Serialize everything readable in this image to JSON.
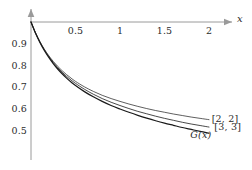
{
  "chart_data": {
    "type": "line",
    "title": "",
    "subtitle": "",
    "xlabel": "x",
    "ylabel": "",
    "xlim": [
      0,
      2.2
    ],
    "ylim": [
      0.45,
      1.0
    ],
    "grid": false,
    "legend_position": "inline-right-end",
    "x_ticks": [
      {
        "value": 0.5,
        "label": "0.5"
      },
      {
        "value": 1,
        "label": "1"
      },
      {
        "value": 1.5,
        "label": "1.5"
      },
      {
        "value": 2,
        "label": "2"
      }
    ],
    "y_ticks": [
      {
        "value": 0.9,
        "label": "0.9"
      },
      {
        "value": 0.8,
        "label": "0.8"
      },
      {
        "value": 0.7,
        "label": "0.7"
      },
      {
        "value": 0.6,
        "label": "0.6"
      },
      {
        "value": 0.5,
        "label": "0.5"
      }
    ],
    "axis_style": {
      "x_axis_value": 1.0,
      "x_axis_color": "#9a9a9a",
      "y_axis_color": "#9a9a9a",
      "arrowheads": true,
      "curve_color": "#1a1a1a"
    },
    "x": [
      0,
      0.05,
      0.1,
      0.15,
      0.2,
      0.25,
      0.3,
      0.35,
      0.4,
      0.45,
      0.5,
      0.6,
      0.7,
      0.8,
      0.9,
      1.0,
      1.1,
      1.2,
      1.3,
      1.4,
      1.5,
      1.6,
      1.7,
      1.8,
      1.9,
      2.0
    ],
    "series": [
      {
        "name": "[2, 2]",
        "label": "[2, 2]",
        "label_x": 2.03,
        "label_y": 0.552,
        "width": 0.7,
        "values": [
          1.0,
          0.951,
          0.91,
          0.875,
          0.845,
          0.819,
          0.796,
          0.776,
          0.758,
          0.742,
          0.727,
          0.702,
          0.681,
          0.663,
          0.648,
          0.635,
          0.623,
          0.612,
          0.602,
          0.593,
          0.585,
          0.577,
          0.57,
          0.563,
          0.557,
          0.551
        ]
      },
      {
        "name": "[3, 3]",
        "label": "[3, 3]",
        "label_x": 2.06,
        "label_y": 0.518,
        "width": 0.8,
        "values": [
          1.0,
          0.95,
          0.908,
          0.872,
          0.841,
          0.814,
          0.79,
          0.769,
          0.75,
          0.733,
          0.718,
          0.691,
          0.668,
          0.648,
          0.631,
          0.616,
          0.602,
          0.589,
          0.578,
          0.567,
          0.557,
          0.548,
          0.539,
          0.531,
          0.524,
          0.517
        ]
      },
      {
        "name": "G(x)",
        "label": "G(x)",
        "label_x": 1.79,
        "label_y": 0.481,
        "width": 1.25,
        "values": [
          1.0,
          0.949,
          0.906,
          0.869,
          0.837,
          0.809,
          0.784,
          0.762,
          0.742,
          0.724,
          0.708,
          0.68,
          0.656,
          0.635,
          0.616,
          0.6,
          0.585,
          0.571,
          0.558,
          0.546,
          0.535,
          0.525,
          0.515,
          0.506,
          0.497,
          0.489
        ]
      }
    ]
  }
}
